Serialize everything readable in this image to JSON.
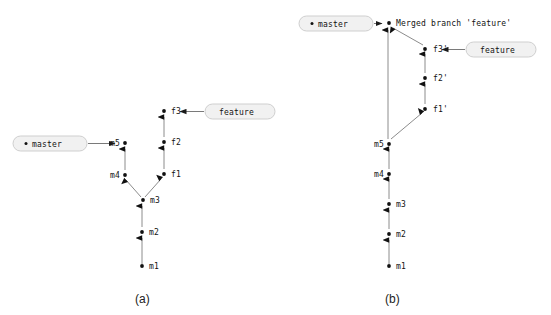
{
  "figure": {
    "background_color": "#ffffff",
    "edge_color": "#8c8c8c",
    "node_color": "#111111",
    "pill_fill": "#f1f1f1",
    "pill_stroke": "#cfcfcf"
  },
  "panels": [
    {
      "id": "a",
      "caption": "(a)",
      "refs": [
        {
          "name": "master-ref",
          "label": "master",
          "bulleted": true
        },
        {
          "name": "feature-ref",
          "label": "feature",
          "bulleted": false
        }
      ],
      "commits": [
        {
          "id": "m1",
          "label": "m1",
          "label_side": "right"
        },
        {
          "id": "m2",
          "label": "m2",
          "label_side": "right"
        },
        {
          "id": "m3",
          "label": "m3",
          "label_side": "right"
        },
        {
          "id": "m4",
          "label": "m4",
          "label_side": "left"
        },
        {
          "id": "m5",
          "label": "m5",
          "label_side": "left"
        },
        {
          "id": "f1",
          "label": "f1",
          "label_side": "right"
        },
        {
          "id": "f2",
          "label": "f2",
          "label_side": "right"
        },
        {
          "id": "f3",
          "label": "f3",
          "label_side": "right"
        }
      ],
      "edges": [
        {
          "from": "m1",
          "to": "m2"
        },
        {
          "from": "m2",
          "to": "m3"
        },
        {
          "from": "m3",
          "to": "m4"
        },
        {
          "from": "m4",
          "to": "m5"
        },
        {
          "from": "m3",
          "to": "f1"
        },
        {
          "from": "f1",
          "to": "f2"
        },
        {
          "from": "f2",
          "to": "f3"
        }
      ],
      "ref_points_to": {
        "master": "m5",
        "feature": "f3"
      }
    },
    {
      "id": "b",
      "caption": "(b)",
      "refs": [
        {
          "name": "master-ref",
          "label": "master",
          "bulleted": true
        },
        {
          "name": "feature-ref",
          "label": "feature",
          "bulleted": false
        }
      ],
      "commits": [
        {
          "id": "m1",
          "label": "m1",
          "label_side": "right"
        },
        {
          "id": "m2",
          "label": "m2",
          "label_side": "right"
        },
        {
          "id": "m3",
          "label": "m3",
          "label_side": "right"
        },
        {
          "id": "m4",
          "label": "m4",
          "label_side": "left"
        },
        {
          "id": "m5",
          "label": "m5",
          "label_side": "left"
        },
        {
          "id": "f1p",
          "label": "f1'",
          "label_side": "right"
        },
        {
          "id": "f2p",
          "label": "f2'",
          "label_side": "right"
        },
        {
          "id": "f3p",
          "label": "f3'",
          "label_side": "right"
        },
        {
          "id": "merge",
          "label": "Merged branch 'feature'",
          "label_side": "right"
        }
      ],
      "edges": [
        {
          "from": "m1",
          "to": "m2"
        },
        {
          "from": "m2",
          "to": "m3"
        },
        {
          "from": "m3",
          "to": "m4"
        },
        {
          "from": "m4",
          "to": "m5"
        },
        {
          "from": "m5",
          "to": "f1p"
        },
        {
          "from": "f1p",
          "to": "f2p"
        },
        {
          "from": "f2p",
          "to": "f3p"
        },
        {
          "from": "f3p",
          "to": "merge"
        },
        {
          "from": "m5",
          "to": "merge"
        }
      ],
      "ref_points_to": {
        "master": "merge",
        "feature": "f3p"
      }
    }
  ]
}
